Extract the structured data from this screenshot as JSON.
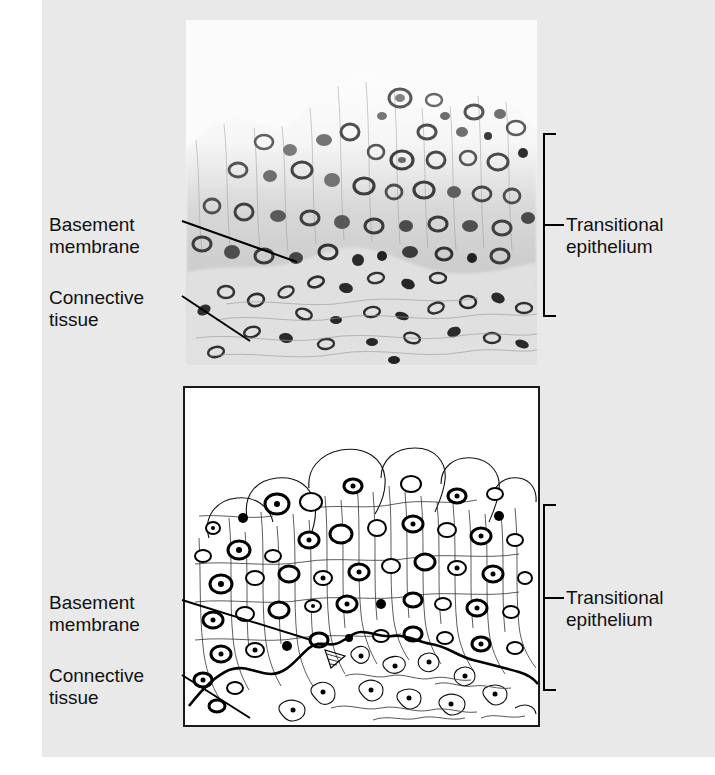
{
  "figure": {
    "title": "Transitional epithelium",
    "background_color": "#e9e9e9",
    "panel_count": 2
  },
  "panels": [
    {
      "id": "micrograph",
      "kind": "light-micrograph",
      "tone": "grayscale",
      "labels": [
        {
          "id": "basement-membrane",
          "text": "Basement\nmembrane",
          "side": "left"
        },
        {
          "id": "connective-tissue",
          "text": "Connective\ntissue",
          "side": "left"
        },
        {
          "id": "transitional-epithelium",
          "text": "Transitional\nepithelium",
          "side": "right"
        }
      ]
    },
    {
      "id": "diagram",
      "kind": "line-drawing",
      "tone": "black-and-white",
      "labels": [
        {
          "id": "basement-membrane",
          "text": "Basement\nmembrane",
          "side": "left"
        },
        {
          "id": "connective-tissue",
          "text": "Connective\ntissue",
          "side": "left"
        },
        {
          "id": "transitional-epithelium",
          "text": "Transitional\nepithelium",
          "side": "right"
        }
      ]
    }
  ],
  "labels": {
    "basement_membrane": "Basement\nmembrane",
    "connective_tissue": "Connective\ntissue",
    "transitional_epithelium": "Transitional\nepithelium"
  },
  "colors": {
    "page_background": "#ffffff",
    "plate_background": "#e9e9e9",
    "diagram_background": "#ffffff",
    "ink": "#111111",
    "micrograph_light": "#fbfbfb"
  },
  "annotations": {
    "bracket_top": {
      "label": "transitional_epithelium",
      "y_from": 134,
      "y_to": 316
    },
    "bracket_bottom": {
      "label": "transitional_epithelium",
      "y_from": 505,
      "y_to": 690
    },
    "leader_basement_membrane_top": {
      "from": [
        182,
        221
      ],
      "to": [
        297,
        262
      ]
    },
    "leader_connective_tissue_top": {
      "from": [
        182,
        296
      ],
      "to": [
        250,
        341
      ]
    },
    "leader_basement_membrane_bottom": {
      "from": [
        182,
        600
      ],
      "to": [
        311,
        640
      ]
    },
    "leader_connective_tissue_bottom": {
      "from": [
        182,
        675
      ],
      "to": [
        250,
        718
      ]
    }
  }
}
